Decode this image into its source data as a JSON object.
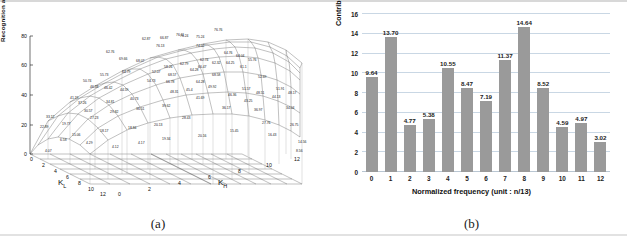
{
  "figure": {
    "panel_a_caption": "(a)",
    "panel_b_caption": "(b)"
  },
  "chart_data": [
    {
      "type": "surface",
      "panel": "(a)",
      "title": "",
      "xlabel": "K_L",
      "xlabel_base": "K",
      "xlabel_sub": "L",
      "ylabel_base": "K",
      "ylabel_sub": "H",
      "ylabel": "K_H",
      "zlabel": "Recognition accuracy(%)",
      "z_ticks": [
        "0",
        "20",
        "40",
        "60",
        "80"
      ],
      "zlim": [
        0,
        80
      ],
      "kl_ticks": [
        "0",
        "2",
        "4",
        "6",
        "8",
        "10",
        "12"
      ],
      "kh_ticks": [
        "0",
        "2",
        "4",
        "6",
        "8",
        "10",
        "12"
      ],
      "grid": true,
      "labeled_values": [
        "4.07",
        "22.89",
        "33.12",
        "6.58",
        "41.19",
        "19.77",
        "46.58",
        "50.74",
        "15.06",
        "30.57",
        "37.26",
        "27.23",
        "46.42",
        "55.73",
        "18.17",
        "29.82",
        "34.81",
        "44.59",
        "64.79",
        "69.66",
        "62.76",
        "68.07",
        "18.84",
        "36.51",
        "40.73",
        "54.73",
        "52.07",
        "62.87",
        "66.87",
        "70.13",
        "76.24",
        "20.13",
        "39.62",
        "48.31",
        "58.26",
        "68.57",
        "66.78",
        "62.79",
        "76.11",
        "75.24",
        "74.02",
        "28.43",
        "45.4",
        "48.31",
        "64.28",
        "66.47",
        "62.74",
        "62.32",
        "76.76",
        "64.76",
        "19.34",
        "41.69",
        "49.92",
        "68.58",
        "64.25",
        "64.04",
        "20.16",
        "46.36",
        "51.57",
        "61.1",
        "55.76",
        "36.17",
        "43.25",
        "48.51",
        "52.69",
        "15.45",
        "36.97",
        "44.13",
        "51.91",
        "48.17",
        "27.76",
        "34.04",
        "16.43",
        "26.75",
        "14.56",
        "8.56",
        "4.17",
        "4.12"
      ]
    },
    {
      "type": "bar",
      "panel": "(b)",
      "title": "",
      "xlabel": "Normalized frequency (unit : n/13)",
      "ylabel": "Contribution to individual DCT point (%)",
      "categories": [
        "0",
        "1",
        "2",
        "3",
        "4",
        "5",
        "6",
        "7",
        "8",
        "9",
        "10",
        "11",
        "12"
      ],
      "values": [
        9.64,
        13.7,
        4.77,
        5.38,
        10.55,
        8.47,
        7.19,
        11.37,
        14.64,
        8.52,
        4.59,
        4.97,
        3.02
      ],
      "value_labels": [
        "9.64",
        "13.70",
        "4.77",
        "5.38",
        "10.55",
        "8.47",
        "7.19",
        "11.37",
        "14.64",
        "8.52",
        "4.59",
        "4.97",
        "3.02"
      ],
      "ylim": [
        0,
        16
      ],
      "y_ticks": [
        "0",
        "2",
        "4",
        "6",
        "8",
        "10",
        "12",
        "14",
        "16"
      ],
      "grid": true,
      "legend": "none",
      "bar_color": "#9a9a9a",
      "grid_color": "#c9d7e4"
    }
  ]
}
